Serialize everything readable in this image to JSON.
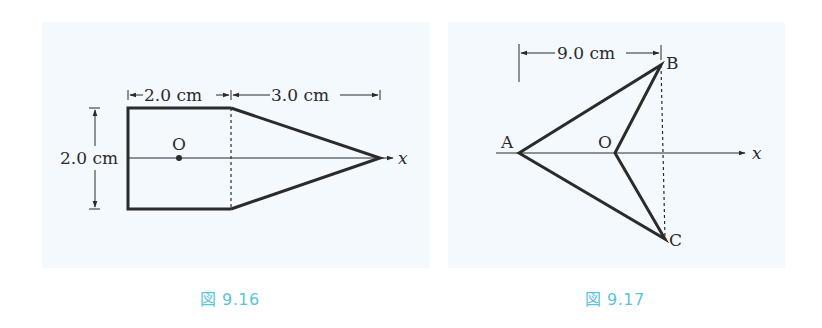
{
  "figures": [
    {
      "id": "fig-9-16",
      "caption": "図 9.16",
      "shape": "rectangle plus triangle (pentagon)",
      "labels": {
        "width_rect": "2.0 cm",
        "width_triangle": "3.0 cm",
        "height": "2.0 cm",
        "origin": "O",
        "axis": "x"
      }
    },
    {
      "id": "fig-9-17",
      "caption": "図 9.17",
      "shape": "arrowhead quadrilateral A-B-O-C",
      "labels": {
        "distance": "9.0 cm",
        "point_a": "A",
        "point_b": "B",
        "point_c": "C",
        "origin": "O",
        "axis": "x"
      }
    }
  ],
  "colors": {
    "panel_bg": "#f3f9fc",
    "line": "#2b2b2b",
    "caption": "#5bc3df"
  }
}
